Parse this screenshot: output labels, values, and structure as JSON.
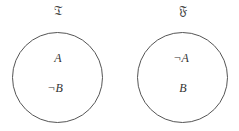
{
  "worlds": [
    {
      "label": "𝔗",
      "literals": [
        "A",
        "¬B"
      ]
    },
    {
      "label": "𝔉",
      "literals": [
        "¬A",
        "B"
      ]
    }
  ]
}
